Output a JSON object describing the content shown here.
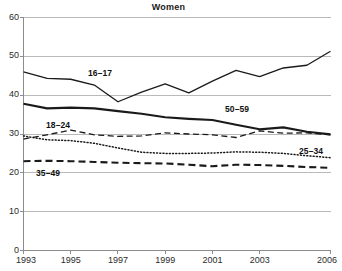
{
  "chart_data": {
    "type": "line",
    "title": "Women",
    "xlabel": "",
    "ylabel": "",
    "xlim": [
      1993,
      2006
    ],
    "ylim": [
      0,
      60
    ],
    "grid": "horizontal",
    "legend_position": "inline-labels",
    "x": [
      1993,
      1994,
      1995,
      1996,
      1997,
      1998,
      1999,
      2000,
      2001,
      2002,
      2003,
      2004,
      2005,
      2006
    ],
    "xticks": [
      "1993",
      "1995",
      "1997",
      "1999",
      "2001",
      "2003",
      "2006"
    ],
    "xtick_values": [
      1993,
      1995,
      1997,
      1999,
      2001,
      2003,
      2006
    ],
    "yticks": [
      "0",
      "10",
      "20",
      "30",
      "40",
      "50",
      "60"
    ],
    "ytick_values": [
      0,
      10,
      20,
      30,
      40,
      50,
      60
    ],
    "series": [
      {
        "name": "16–17",
        "style": "solid-thin",
        "values": [
          46.0,
          44.3,
          44.1,
          42.6,
          38.3,
          40.8,
          42.9,
          40.6,
          43.6,
          46.4,
          44.8,
          47.0,
          47.7,
          51.3
        ]
      },
      {
        "name": "50–59",
        "style": "solid-thick",
        "values": [
          37.8,
          36.6,
          36.8,
          36.6,
          35.9,
          35.2,
          34.3,
          33.9,
          33.6,
          32.4,
          31.2,
          31.7,
          30.6,
          29.9
        ]
      },
      {
        "name": "18–24",
        "style": "dashed",
        "values": [
          28.7,
          29.8,
          31.0,
          29.8,
          29.4,
          29.5,
          30.3,
          30.0,
          29.8,
          29.1,
          30.8,
          30.2,
          30.3,
          29.8
        ]
      },
      {
        "name": "25–34",
        "style": "dotted",
        "values": [
          29.5,
          28.5,
          28.3,
          27.6,
          26.4,
          25.3,
          25.0,
          25.0,
          25.1,
          25.4,
          25.3,
          25.0,
          24.4,
          23.9
        ]
      },
      {
        "name": "35–49",
        "style": "dashed-bold",
        "values": [
          23.0,
          23.1,
          23.0,
          22.8,
          22.6,
          22.5,
          22.4,
          22.1,
          21.7,
          22.1,
          22.0,
          21.8,
          21.5,
          21.3
        ]
      }
    ],
    "annotations": [
      {
        "text": "16–17",
        "series": "16–17"
      },
      {
        "text": "50–59",
        "series": "50–59"
      },
      {
        "text": "18–24",
        "series": "18–24"
      },
      {
        "text": "25–34",
        "series": "25–34"
      },
      {
        "text": "35–49",
        "series": "35–49"
      }
    ],
    "colors": {
      "line": "#1a1a1a",
      "grid": "#b9b9b9",
      "axis": "#8c8c8c",
      "text": "#2b2b2b",
      "background": "#ffffff"
    }
  }
}
